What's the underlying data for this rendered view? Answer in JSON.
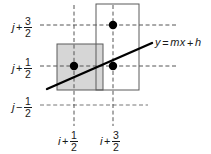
{
  "figure": {
    "type": "geometry-diagram",
    "width": 211,
    "height": 154,
    "background": "#ffffff"
  },
  "colors": {
    "line": "#000000",
    "dashed_grid": "#555555",
    "square_stroke": "#5a5a5a",
    "shaded_fill": "#d6d6d6",
    "text": "#1a1a1a",
    "dot": "#000000"
  },
  "y_axis": {
    "ticks": [
      {
        "name": "y-tick-j-plus-3-2",
        "base": "j",
        "op": "+",
        "num": "3",
        "den": "2",
        "y": 25
      },
      {
        "name": "y-tick-j-plus-1-2",
        "base": "j",
        "op": "+",
        "num": "1",
        "den": "2",
        "y": 66
      },
      {
        "name": "y-tick-j-minus-1-2",
        "base": "j",
        "op": "−",
        "num": "1",
        "den": "2",
        "y": 105
      }
    ]
  },
  "x_axis": {
    "ticks": [
      {
        "name": "x-tick-i-plus-1-2",
        "base": "i",
        "op": "+",
        "num": "1",
        "den": "2",
        "x": 74
      },
      {
        "name": "x-tick-i-plus-3-2",
        "base": "i",
        "op": "+",
        "num": "3",
        "den": "2",
        "x": 113
      }
    ]
  },
  "line": {
    "equation_label": "y = mx + h",
    "equation_parts": {
      "y": "y",
      "eq": "=",
      "m": "m",
      "x": "x",
      "plus": "+",
      "h": "h"
    },
    "x1": 47,
    "y1": 89,
    "x2": 152,
    "y2": 43,
    "stroke_width": 2.4
  },
  "squares": [
    {
      "name": "shaded-cell",
      "x": 57,
      "y": 44,
      "width": 46,
      "height": 46,
      "fill": "#d6d6d6"
    },
    {
      "name": "outlined-cell",
      "x": 96,
      "y": 4,
      "width": 43,
      "height": 86,
      "fill": "none"
    }
  ],
  "dots": [
    {
      "name": "grid-point-upper",
      "cx": 113,
      "cy": 25,
      "r": 4.2
    },
    {
      "name": "grid-point-left",
      "cx": 74,
      "cy": 66,
      "r": 4.2
    },
    {
      "name": "grid-point-right",
      "cx": 113,
      "cy": 66,
      "r": 4.2
    }
  ],
  "dashed_lines": {
    "horizontal": [
      {
        "name": "gridline-h-j-plus-3-2",
        "y": 25,
        "x1": 40,
        "x2": 176
      },
      {
        "name": "gridline-h-j-plus-1-2",
        "y": 66,
        "x1": 40,
        "x2": 176
      },
      {
        "name": "gridline-h-j-minus-1-2",
        "y": 105,
        "x1": 40,
        "x2": 148
      }
    ],
    "vertical": [
      {
        "name": "gridline-v-i-plus-1-2",
        "x": 74,
        "y1": 5,
        "y2": 126
      },
      {
        "name": "gridline-v-i-plus-3-2",
        "x": 113,
        "y1": 5,
        "y2": 126
      }
    ]
  }
}
